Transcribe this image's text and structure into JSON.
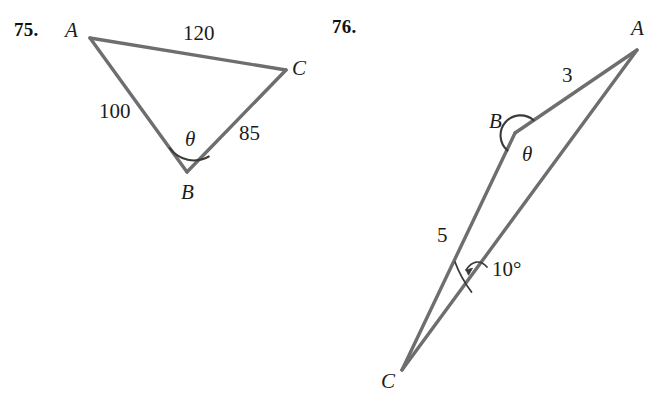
{
  "page": {
    "background": "#ffffff",
    "stroke_color": "#6e6e6e",
    "text_color": "#1c1c1c"
  },
  "figures": [
    {
      "number_label": "75.",
      "shape": "triangle",
      "vertices": {
        "A": "A",
        "B": "B",
        "C": "C"
      },
      "sides": {
        "AC": "120",
        "AB": "100",
        "BC": "85"
      },
      "angle": {
        "at": "B",
        "symbol": "θ"
      }
    },
    {
      "number_label": "76.",
      "shape": "triangle",
      "vertices": {
        "A": "A",
        "B": "B",
        "C": "C"
      },
      "sides": {
        "AB": "3",
        "BC": "5"
      },
      "angles": [
        {
          "at": "B",
          "symbol": "θ"
        },
        {
          "at": "C",
          "value": "10°"
        }
      ]
    }
  ],
  "labels": {
    "fig75_number": "75.",
    "fig75_A": "A",
    "fig75_B": "B",
    "fig75_C": "C",
    "fig75_side_AC": "120",
    "fig75_side_AB": "100",
    "fig75_side_BC": "85",
    "fig75_theta": "θ",
    "fig76_number": "76.",
    "fig76_A": "A",
    "fig76_B": "B",
    "fig76_C": "C",
    "fig76_side_AB": "3",
    "fig76_side_BC": "5",
    "fig76_theta": "θ",
    "fig76_angle_C": "10°"
  }
}
